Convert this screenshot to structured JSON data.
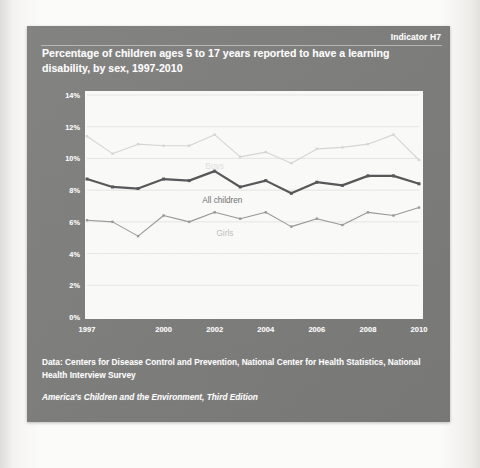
{
  "slide": {
    "indicator": "Indicator H7",
    "title": "Percentage of children ages 5 to 17 years reported to have a learning disability, by sex, 1997-2010",
    "panel_color": "#7e7e7c",
    "plot_background": "#fdfdfc",
    "text_color": "#ffffff"
  },
  "footer": {
    "source": "Data: Centers for Disease Control and Prevention, National Center for Health Statistics, National Health Interview Survey",
    "publication": "America's Children and the Environment, Third Edition"
  },
  "chart_data": {
    "type": "line",
    "title": "Percentage of children ages 5 to 17 years reported to have a learning disability, by sex, 1997-2010",
    "xlabel": "",
    "ylabel": "",
    "ylim": [
      0,
      14
    ],
    "ytick_values": [
      0,
      2,
      4,
      6,
      8,
      10,
      12,
      14
    ],
    "ytick_labels": [
      "0%",
      "2%",
      "4%",
      "6%",
      "8%",
      "10%",
      "12%",
      "14%"
    ],
    "xlim": [
      1997,
      2010
    ],
    "x": [
      1997,
      1998,
      1999,
      2000,
      2001,
      2002,
      2003,
      2004,
      2005,
      2006,
      2007,
      2008,
      2009,
      2010
    ],
    "xtick_values": [
      1997,
      2000,
      2002,
      2004,
      2006,
      2008,
      2010
    ],
    "xtick_labels": [
      "1997",
      "2000",
      "2002",
      "2004",
      "2006",
      "2008",
      "2010"
    ],
    "grid": true,
    "gridlines": "horizontal",
    "legend": "inline-series-labels",
    "series": [
      {
        "name": "Boys",
        "color": "#d8d8d6",
        "marker": "square",
        "line_width": 1.1,
        "label_position": {
          "x": 2002.0,
          "y": 9.5
        },
        "values": [
          11.4,
          10.3,
          10.9,
          10.8,
          10.8,
          11.5,
          10.1,
          10.4,
          9.7,
          10.6,
          10.7,
          10.9,
          11.5,
          9.9
        ]
      },
      {
        "name": "All children",
        "color": "#58585a",
        "marker": "square",
        "line_width": 2.2,
        "label_position": {
          "x": 2002.3,
          "y": 7.4
        },
        "values": [
          8.7,
          8.2,
          8.1,
          8.7,
          8.6,
          9.2,
          8.2,
          8.6,
          7.8,
          8.5,
          8.3,
          8.9,
          8.9,
          8.4
        ]
      },
      {
        "name": "Girls",
        "color": "#9a9a98",
        "marker": "square",
        "line_width": 1.1,
        "label_position": {
          "x": 2002.4,
          "y": 5.3
        },
        "values": [
          6.1,
          6.0,
          5.1,
          6.4,
          6.0,
          6.6,
          6.2,
          6.6,
          5.7,
          6.2,
          5.8,
          6.6,
          6.4,
          6.9
        ]
      }
    ]
  }
}
